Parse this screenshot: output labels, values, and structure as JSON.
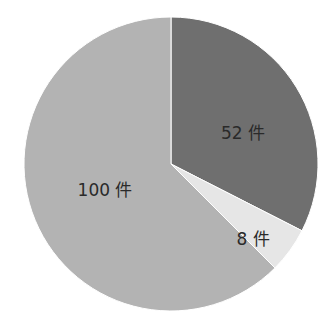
{
  "chart_data": {
    "type": "pie",
    "title": "",
    "unit": "件",
    "start_angle_deg": 0,
    "direction": "clockwise",
    "slices": [
      {
        "label": "52 件",
        "value": 52,
        "color": "#6f6f6f"
      },
      {
        "label": "8 件",
        "value": 8,
        "color": "#e6e6e6"
      },
      {
        "label": "100 件",
        "value": 100,
        "color": "#b3b3b3"
      }
    ],
    "legend": null,
    "grid": false
  },
  "labels": {
    "slice0": "52 件",
    "slice1": "8 件",
    "slice2": "100 件"
  }
}
